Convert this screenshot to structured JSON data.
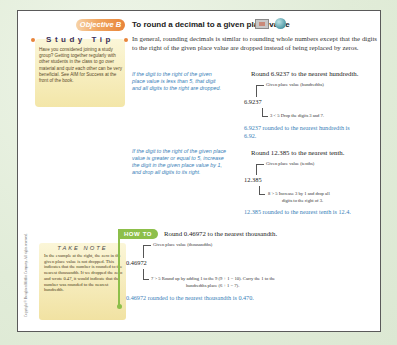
{
  "objective": {
    "badge": "Objective B",
    "title": "To round a decimal to a given place value",
    "icons": [
      "video-icon",
      "globe-icon"
    ]
  },
  "study_tip": {
    "title": "Study Tip",
    "body": "Have you considered joining a study group? Getting together regularly with other students in the class to go over material and quiz each other can be very beneficial. See AIM for Success at the front of the book."
  },
  "intro": "In general, rounding decimals is similar to rounding whole numbers except that the digits to the right of the given place value are dropped instead of being replaced by zeros.",
  "rules": [
    "If the digit to the right of the given place value is less than 5, that digit and all digits to the right are dropped.",
    "If the digit to the right of the given place value is greater or equal to 5, increase the digit in the given place value by 1, and drop all digits to its right."
  ],
  "examples": [
    {
      "heading": "Round 6.9237 to the nearest hundredth.",
      "place_label": "Given place value (hundredths)",
      "number": "6.9237",
      "note_line1": "3 < 5   Drop the digits 3 and 7.",
      "note_line2": "",
      "result": "6.9237 rounded to the nearest hundredth is 6.92."
    },
    {
      "heading": "Round 12.385 to the nearest tenth.",
      "place_label": "Given place value (tenths)",
      "number": "12.385",
      "note_line1": "8 > 5   Increase 3 by 1 and drop all",
      "note_line2": "digits to the right of 3.",
      "result": "12.385 rounded to the nearest tenth is 12.4."
    }
  ],
  "take_note": {
    "title": "TAKE NOTE",
    "body": "In the example at the right, the zero in the given place value is not dropped. This indicates that the number is rounded to the nearest thousandth. If we dropped the zero and wrote 0.47, it would indicate that the number was rounded to the nearest hundredth."
  },
  "how_to": {
    "badge": "HOW TO",
    "heading": "Round 0.46972 to the nearest thousandth.",
    "place_label": "Given place value (thousandths)",
    "number": "0.46972",
    "note_line1": "7 > 5   Round up by adding 1 to the 9 (9 + 1 = 10). Carry the 1 to the",
    "note_line2": "hundredths place (6 + 1 = 7).",
    "result": "0.46972 rounded to the nearest thousandth is 0.470."
  },
  "copyright": "Copyright © Houghton Mifflin Company. All rights reserved.",
  "colors": {
    "objective_orange": "#e8843a",
    "rule_blue": "#3a7fb8",
    "howto_green": "#8dbf4a",
    "note_yellow": "#f3e6a8",
    "background_green": "#e3eedb"
  }
}
